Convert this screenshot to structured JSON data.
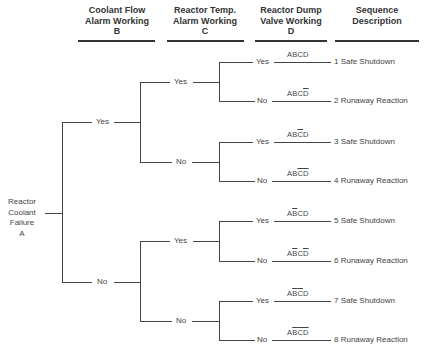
{
  "headers": {
    "b": {
      "line1": "Coolant Flow",
      "line2": "Alarm Working",
      "line3": "B"
    },
    "c": {
      "line1": "Reactor Temp.",
      "line2": "Alarm Working",
      "line3": "C"
    },
    "d": {
      "line1": "Reactor Dump",
      "line2": "Valve Working",
      "line3": "D"
    },
    "seq": {
      "line1": "Sequence",
      "line2": "Description"
    }
  },
  "root": {
    "line1": "Reactor",
    "line2": "Coolant",
    "line3": "Failure",
    "line4": "A"
  },
  "branches": {
    "b_yes": "Yes",
    "b_no": "No",
    "c_yes_yes": "Yes",
    "c_yes_no": "No",
    "c_no_yes": "Yes",
    "c_no_no": "No"
  },
  "sequences": [
    {
      "d_label": "Yes",
      "code": [
        {
          "t": "A",
          "bar": false
        },
        {
          "t": "B",
          "bar": false
        },
        {
          "t": "C",
          "bar": false
        },
        {
          "t": "D",
          "bar": false
        }
      ],
      "description": "1 Safe Shutdown"
    },
    {
      "d_label": "No",
      "code": [
        {
          "t": "A",
          "bar": false
        },
        {
          "t": "B",
          "bar": false
        },
        {
          "t": "C",
          "bar": false
        },
        {
          "t": "D",
          "bar": true
        }
      ],
      "description": "2 Runaway Reaction"
    },
    {
      "d_label": "Yes",
      "code": [
        {
          "t": "A",
          "bar": false
        },
        {
          "t": "B",
          "bar": false
        },
        {
          "t": "C",
          "bar": true
        },
        {
          "t": "D",
          "bar": false
        }
      ],
      "description": "3 Safe Shutdown"
    },
    {
      "d_label": "No",
      "code": [
        {
          "t": "A",
          "bar": false
        },
        {
          "t": "B",
          "bar": false
        },
        {
          "t": "C",
          "bar": true
        },
        {
          "t": "D",
          "bar": true
        }
      ],
      "description": "4 Runaway Reaction"
    },
    {
      "d_label": "Yes",
      "code": [
        {
          "t": "A",
          "bar": false
        },
        {
          "t": "B",
          "bar": true
        },
        {
          "t": "C",
          "bar": false
        },
        {
          "t": "D",
          "bar": false
        }
      ],
      "description": "5 Safe Shutdown"
    },
    {
      "d_label": "No",
      "code": [
        {
          "t": "A",
          "bar": false
        },
        {
          "t": "B",
          "bar": true
        },
        {
          "t": "C",
          "bar": false
        },
        {
          "t": "D",
          "bar": true
        }
      ],
      "description": "6 Runaway Reaction"
    },
    {
      "d_label": "Yes",
      "code": [
        {
          "t": "A",
          "bar": false
        },
        {
          "t": "B",
          "bar": true
        },
        {
          "t": "C",
          "bar": true
        },
        {
          "t": "D",
          "bar": false
        }
      ],
      "description": "7 Safe Shutdown"
    },
    {
      "d_label": "No",
      "code": [
        {
          "t": "A",
          "bar": false
        },
        {
          "t": "B",
          "bar": true
        },
        {
          "t": "C",
          "bar": true
        },
        {
          "t": "D",
          "bar": true
        }
      ],
      "description": "8 Runaway Reaction"
    }
  ],
  "codes_text": [
    "ABCD",
    "ABC̅D̅",
    "ABC̅D",
    "ABC̅D̅",
    "AB̅CD",
    "AB̅CD̅",
    "AB̅C̅D",
    "AB̅C̅D̅"
  ]
}
